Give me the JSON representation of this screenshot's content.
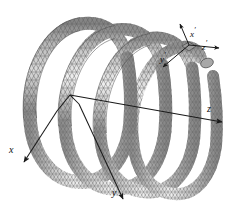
{
  "figure": {
    "background_color": "#ffffff",
    "mesh": {
      "style": "triangulated-surface-mesh",
      "line_color": "#5a5a5a",
      "fill_light": "#f2f2f2",
      "fill_mid": "#b9b9b9",
      "fill_dark": "#7e7e7e",
      "turns": 4
    }
  },
  "global_axes": {
    "name": "global-coordinate-system",
    "origin_label": "",
    "axes": [
      {
        "key": "x",
        "label": "x",
        "prime": false,
        "direction": "down-left"
      },
      {
        "key": "y",
        "label": "y",
        "prime": false,
        "direction": "down"
      },
      {
        "key": "z",
        "label": "z",
        "prime": false,
        "direction": "right"
      }
    ]
  },
  "local_axes": {
    "name": "local-coordinate-system",
    "axes": [
      {
        "key": "xp",
        "label": "x",
        "prime": true,
        "direction": "up"
      },
      {
        "key": "yp",
        "label": "y",
        "prime": true,
        "direction": "down-left"
      },
      {
        "key": "zp",
        "label": "z",
        "prime": true,
        "direction": "right"
      }
    ]
  },
  "labels": {
    "x": "x",
    "y": "y",
    "z": "z",
    "x_prime_base": "x",
    "y_prime_base": "y",
    "z_prime_base": "z",
    "prime_mark": "′"
  },
  "colors": {
    "axis_line": "#1a1a1a",
    "label_text": "#111111",
    "mesh_line": "#5a5a5a",
    "background": "#ffffff"
  }
}
